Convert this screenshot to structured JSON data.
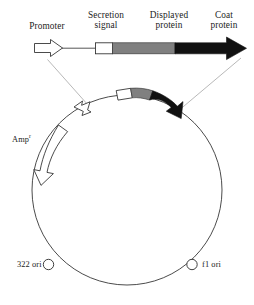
{
  "figure": {
    "type": "phagemid-vector-diagram",
    "colors": {
      "outline": "#2b2b2b",
      "white_fill": "#ffffff",
      "gray_fill": "#808080",
      "black_fill": "#111111",
      "leader_line": "#8e8e8e",
      "background": "#ffffff"
    }
  },
  "linear_construct": {
    "name": "expression cassette (linear, expanded)",
    "elements": [
      {
        "key": "promoter",
        "label": "Promoter",
        "shape": "open-arrow-right",
        "fill": "#ffffff"
      },
      {
        "key": "secretion_signal",
        "label": "Secretion\nsignal",
        "label_line1": "Secretion",
        "label_line2": "signal",
        "shape": "open-box",
        "fill": "#ffffff"
      },
      {
        "key": "displayed_protein",
        "label": "Displayed\nprotein",
        "label_line1": "Displayed",
        "label_line2": "protein",
        "shape": "bar",
        "fill": "#808080"
      },
      {
        "key": "coat_protein",
        "label": "Coat\nprotein",
        "label_line1": "Coat",
        "label_line2": "protein",
        "shape": "filled-arrow-right",
        "fill": "#111111"
      }
    ]
  },
  "plasmid": {
    "name": "circular phagemid backbone",
    "features": [
      {
        "key": "plasmid_promoter",
        "label": "",
        "shape": "open-arrow",
        "fill": "#ffffff",
        "position": "upper-left arc"
      },
      {
        "key": "plasmid_secretion_signal",
        "label": "",
        "shape": "open-box",
        "fill": "#ffffff",
        "position": "top arc"
      },
      {
        "key": "plasmid_displayed_protein",
        "label": "",
        "shape": "bar",
        "fill": "#808080",
        "position": "top arc"
      },
      {
        "key": "plasmid_coat_protein",
        "label": "",
        "shape": "filled-arrow",
        "fill": "#111111",
        "position": "upper-right arc"
      },
      {
        "key": "amp_resistance",
        "label": "Amp",
        "label_superscript": "r",
        "shape": "open-curved-arrow",
        "fill": "#ffffff",
        "position": "left arc"
      },
      {
        "key": "ori_322",
        "label": "322 ori",
        "shape": "small-circle",
        "fill": "#ffffff",
        "position": "lower-left arc"
      },
      {
        "key": "ori_f1",
        "label": "f1 ori",
        "shape": "small-circle",
        "fill": "#ffffff",
        "position": "lower-right arc"
      }
    ]
  },
  "leader_lines": [
    {
      "key": "leader-left",
      "from": "linear promoter",
      "to": "plasmid promoter"
    },
    {
      "key": "leader-right",
      "from": "linear coat protein arrow tip",
      "to": "plasmid coat protein arrow tip"
    }
  ]
}
